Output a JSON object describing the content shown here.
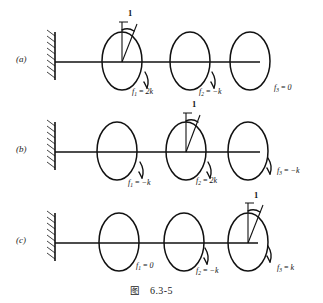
{
  "figure": {
    "caption_label": "图",
    "caption_number": "6.3-5"
  },
  "rows": [
    {
      "tag": "(a)",
      "unit_rotation_disk": 1,
      "unit_rotation_label": "1",
      "forces": [
        {
          "sym": "f",
          "sub": "1",
          "eq": "=",
          "val": "2k",
          "full": "f₁ = 2k"
        },
        {
          "sym": "f",
          "sub": "2",
          "eq": "=",
          "val": "−k",
          "full": "f₂ = −k"
        },
        {
          "sym": "f",
          "sub": "3",
          "eq": "=",
          "val": "0",
          "full": "f₃ = 0"
        }
      ]
    },
    {
      "tag": "(b)",
      "unit_rotation_disk": 2,
      "unit_rotation_label": "1",
      "forces": [
        {
          "sym": "f",
          "sub": "1",
          "eq": "=",
          "val": "−k",
          "full": "f₁ = −k"
        },
        {
          "sym": "f",
          "sub": "2",
          "eq": "=",
          "val": "2k",
          "full": "f₂ = 2k"
        },
        {
          "sym": "f",
          "sub": "3",
          "eq": "=",
          "val": "−k",
          "full": "f₃ = −k"
        }
      ]
    },
    {
      "tag": "(c)",
      "unit_rotation_disk": 3,
      "unit_rotation_label": "1",
      "forces": [
        {
          "sym": "f",
          "sub": "1",
          "eq": "=",
          "val": "0",
          "full": "f₁ = 0"
        },
        {
          "sym": "f",
          "sub": "2",
          "eq": "=",
          "val": "−k",
          "full": "f₂ = −k"
        },
        {
          "sym": "f",
          "sub": "3",
          "eq": "=",
          "val": "k",
          "full": "f₃ = k"
        }
      ]
    }
  ],
  "colors": {
    "ink": "#111111",
    "paper": "#ffffff"
  }
}
